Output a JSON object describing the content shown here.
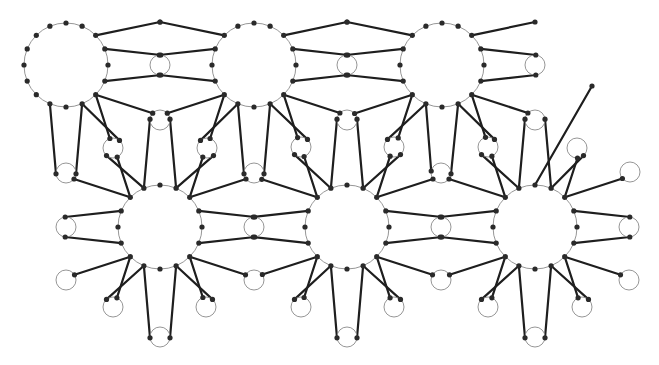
{
  "diagram": {
    "title": "Interlaced 16-point rosette lattice with small connector circles",
    "canvas": {
      "width": 659,
      "height": 365,
      "background": "#ffffff"
    },
    "colors": {
      "strand": "#1e1e1e",
      "circle_outline": "#8a8a8a",
      "node": "#2a2a2a"
    },
    "strand_width": 2.2,
    "circle_stroke_width": 0.9,
    "node_radius": 2.6,
    "rosettes": {
      "radius": 42,
      "dots": 16,
      "ray_offset_deg": 27,
      "max_ray_length": 120,
      "items": [
        {
          "id": "rosette-top-left",
          "cx": 66,
          "cy": 65
        },
        {
          "id": "rosette-top-middle",
          "cx": 254,
          "cy": 65
        },
        {
          "id": "rosette-top-right",
          "cx": 442,
          "cy": 65
        },
        {
          "id": "rosette-bottom-left",
          "cx": 160,
          "cy": 227
        },
        {
          "id": "rosette-bottom-middle",
          "cx": 347,
          "cy": 227
        },
        {
          "id": "rosette-bottom-right",
          "cx": 535,
          "cy": 227
        }
      ]
    },
    "small_circles": {
      "radius": 10,
      "items": [
        [
          160,
          65
        ],
        [
          347,
          65
        ],
        [
          535,
          65
        ],
        [
          160,
          120
        ],
        [
          347,
          120
        ],
        [
          535,
          120
        ],
        [
          113,
          148
        ],
        [
          207,
          148
        ],
        [
          301,
          147
        ],
        [
          394,
          147
        ],
        [
          488,
          147
        ],
        [
          577,
          148
        ],
        [
          66,
          173
        ],
        [
          254,
          173
        ],
        [
          441,
          173
        ],
        [
          630,
          172
        ],
        [
          66,
          227
        ],
        [
          254,
          227
        ],
        [
          441,
          227
        ],
        [
          629,
          227
        ],
        [
          66,
          280
        ],
        [
          254,
          280
        ],
        [
          441,
          280
        ],
        [
          629,
          280
        ],
        [
          113,
          307
        ],
        [
          206,
          307
        ],
        [
          301,
          307
        ],
        [
          394,
          307
        ],
        [
          488,
          307
        ],
        [
          582,
          307
        ],
        [
          160,
          337
        ],
        [
          347,
          337
        ],
        [
          535,
          337
        ]
      ]
    },
    "free_endpoints": [
      [
        160,
        22
      ],
      [
        347,
        22
      ],
      [
        535,
        22
      ],
      [
        608,
        29
      ],
      [
        592,
        44
      ],
      [
        587,
        65
      ],
      [
        592,
        86
      ],
      [
        608,
        101
      ],
      [
        629,
        107
      ],
      [
        28,
        151
      ]
    ]
  }
}
